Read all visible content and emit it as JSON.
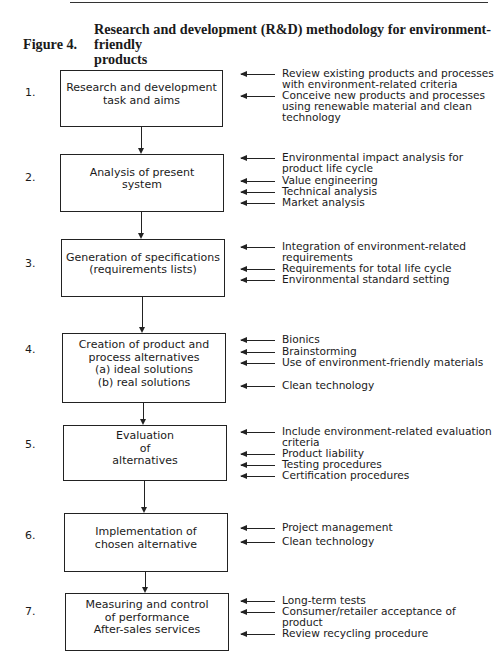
{
  "figure": {
    "label": "Figure 4.",
    "title_line1": "Research and development (R&D) methodology for environment-friendly",
    "title_line2": "products"
  },
  "steps": [
    {
      "number": "1.",
      "box_lines": [
        "Research and development",
        "task and aims"
      ],
      "inputs": [
        "Review existing products and processes with environment-related criteria",
        "Conceive new products and processes using renewable material and clean technology"
      ]
    },
    {
      "number": "2.",
      "box_lines": [
        "Analysis of present",
        "system"
      ],
      "inputs": [
        "Environmental impact analysis for product life cycle",
        "Value engineering",
        "Technical analysis",
        "Market analysis"
      ]
    },
    {
      "number": "3.",
      "box_lines": [
        "Generation of specifications",
        "(requirements lists)"
      ],
      "inputs": [
        "Integration of environment-related requirements",
        "Requirements for total life cycle",
        "Environmental standard setting"
      ]
    },
    {
      "number": "4.",
      "box_lines": [
        "Creation of product and",
        "process alternatives",
        "(a) ideal solutions",
        "(b) real solutions"
      ],
      "inputs": [
        "Bionics",
        "Brainstorming",
        "Use of environment-friendly materials",
        "Clean technology"
      ]
    },
    {
      "number": "5.",
      "box_lines": [
        "Evaluation",
        "of",
        "alternatives"
      ],
      "inputs": [
        "Include environment-related evaluation criteria",
        "Product liability",
        "Testing procedures",
        "Certification procedures"
      ]
    },
    {
      "number": "6.",
      "box_lines": [
        "Implementation of",
        "chosen alternative"
      ],
      "inputs": [
        "Project management",
        "Clean technology"
      ]
    },
    {
      "number": "7.",
      "box_lines": [
        "Measuring and control",
        "of performance",
        "After-sales services"
      ],
      "inputs": [
        "Long-term tests",
        "Consumer/retailer acceptance of product",
        "Review recycling procedure"
      ]
    }
  ]
}
